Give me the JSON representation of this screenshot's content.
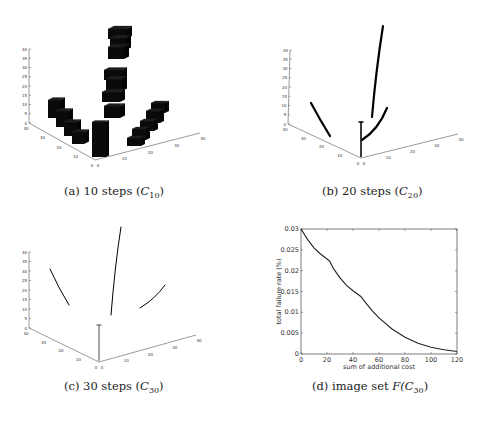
{
  "figure": {
    "panels": [
      {
        "id": "a",
        "caption_prefix": "(a) 10 steps (",
        "caption_symbol": "C",
        "caption_sub": "10",
        "caption_suffix": ")",
        "type": "3d-voxels",
        "z_ticks": [
          "0",
          "5",
          "10",
          "15",
          "20",
          "25",
          "30",
          "35",
          "40"
        ],
        "left_floor_ticks": [
          "40",
          "30",
          "20",
          "10",
          "0"
        ],
        "right_floor_ticks": [
          "0",
          "10",
          "20",
          "30",
          "40"
        ]
      },
      {
        "id": "b",
        "caption_prefix": "(b) 20 steps (",
        "caption_symbol": "C",
        "caption_sub": "20",
        "caption_suffix": ")",
        "type": "3d-curves",
        "z_ticks": [
          "0",
          "5",
          "10",
          "15",
          "20",
          "25",
          "30",
          "35",
          "40"
        ],
        "left_floor_ticks": [
          "40",
          "30",
          "20",
          "10",
          "0"
        ],
        "right_floor_ticks": [
          "0",
          "10",
          "20",
          "30",
          "40"
        ]
      },
      {
        "id": "c",
        "caption_prefix": "(c) 30 steps (",
        "caption_symbol": "C",
        "caption_sub": "30",
        "caption_suffix": ")",
        "type": "3d-curves",
        "z_ticks": [
          "0",
          "5",
          "10",
          "15",
          "20",
          "25",
          "30",
          "35",
          "40"
        ],
        "left_floor_ticks": [
          "40",
          "30",
          "20",
          "10",
          "0"
        ],
        "right_floor_ticks": [
          "0",
          "10",
          "20",
          "30",
          "40"
        ]
      },
      {
        "id": "d",
        "caption_prefix": "(d) image set ",
        "caption_symbol": "F(C",
        "caption_sub": "30",
        "caption_suffix": ")",
        "type": "line"
      }
    ]
  },
  "chart_data": [
    {
      "panel": "d",
      "type": "line",
      "title": "",
      "xlabel": "sum of additional cost",
      "ylabel": "total failure rate (%)",
      "xlim": [
        0,
        120
      ],
      "ylim": [
        0,
        0.03
      ],
      "xticks": [
        "0",
        "20",
        "40",
        "60",
        "80",
        "100",
        "120"
      ],
      "yticks": [
        "0",
        "0.005",
        "0.01",
        "0.015",
        "0.02",
        "0.025",
        "0.03"
      ],
      "grid": false,
      "series": [
        {
          "name": "failure rate",
          "x": [
            0,
            5,
            10,
            15,
            20,
            22,
            25,
            30,
            35,
            40,
            46,
            50,
            55,
            60,
            70,
            80,
            90,
            100,
            110,
            120
          ],
          "y": [
            0.03,
            0.0275,
            0.0255,
            0.024,
            0.0228,
            0.0223,
            0.0205,
            0.0183,
            0.0165,
            0.0152,
            0.0138,
            0.0122,
            0.0103,
            0.0087,
            0.006,
            0.004,
            0.0026,
            0.0016,
            0.001,
            0.0006
          ]
        }
      ]
    }
  ]
}
